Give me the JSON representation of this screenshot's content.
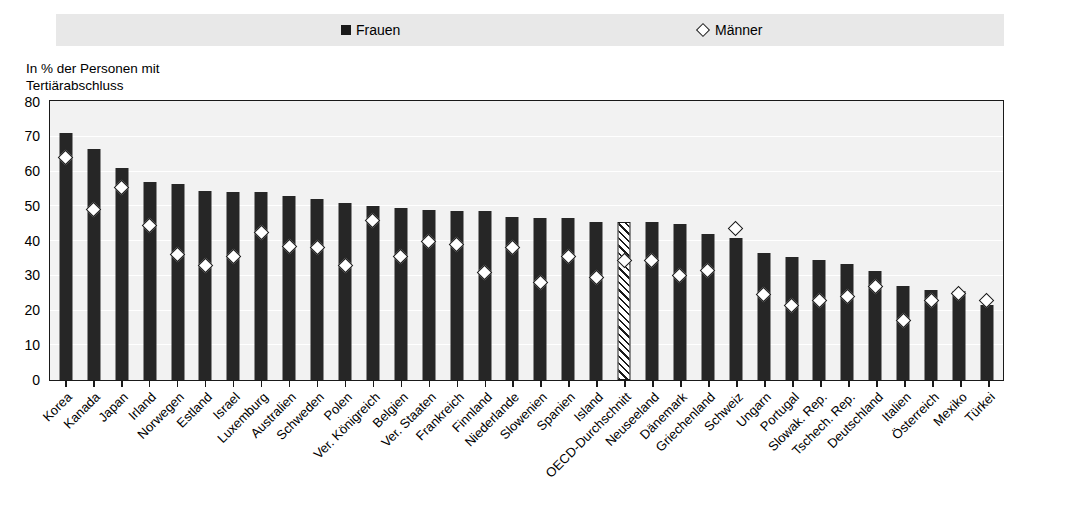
{
  "legend": {
    "items": [
      {
        "label": "Frauen",
        "marker": "filled-square-icon",
        "color": "#262626"
      },
      {
        "label": "Männer",
        "marker": "open-diamond-icon",
        "color": "#ffffff"
      }
    ]
  },
  "axis_caption": "In % der Personen mit\nTertiärabschluss",
  "chart_data": {
    "type": "bar",
    "title": "",
    "subtitle": "",
    "xlabel": "",
    "ylabel": "In % der Personen mit Tertiärabschluss",
    "ylim": [
      0,
      80
    ],
    "yticks": [
      0,
      10,
      20,
      30,
      40,
      50,
      60,
      70,
      80
    ],
    "grid": true,
    "legend_position": "top",
    "highlight_category": "OECD-Durchschnitt",
    "highlight_style": "hatched",
    "categories": [
      "Korea",
      "Kanada",
      "Japan",
      "Irland",
      "Norwegen",
      "Estland",
      "Israel",
      "Luxemburg",
      "Australien",
      "Schweden",
      "Polen",
      "Ver. Königreich",
      "Belgien",
      "Ver. Staaten",
      "Frankreich",
      "Finnland",
      "Niederlande",
      "Slowenien",
      "Spanien",
      "Island",
      "OECD-Durchschnitt",
      "Neuseeland",
      "Dänemark",
      "Griechenland",
      "Schweiz",
      "Ungarn",
      "Portugal",
      "Slowak. Rep.",
      "Tschech. Rep.",
      "Deutschland",
      "Italien",
      "Österreich",
      "Mexiko",
      "Türkei"
    ],
    "series": [
      {
        "name": "Frauen",
        "type": "bar",
        "values": [
          71,
          66.5,
          61,
          57,
          56.5,
          54.5,
          54,
          54,
          53,
          52,
          51,
          50,
          49.5,
          49,
          48.5,
          48.5,
          47,
          46.5,
          46.5,
          45.5,
          45.5,
          45.5,
          45,
          42,
          41,
          36.5,
          35.5,
          34.5,
          33.5,
          31.5,
          27,
          26,
          25.5,
          21.5
        ]
      },
      {
        "name": "Männer",
        "type": "scatter",
        "values": [
          64,
          49,
          55.5,
          44.5,
          36,
          33,
          35.5,
          42.5,
          38.5,
          38,
          33,
          46,
          35.5,
          40,
          39,
          31,
          38,
          28,
          35.5,
          29.5,
          34.5,
          34.5,
          30,
          31.5,
          43.5,
          24.5,
          21.5,
          23,
          24,
          27,
          17,
          23,
          25,
          23
        ]
      }
    ]
  }
}
